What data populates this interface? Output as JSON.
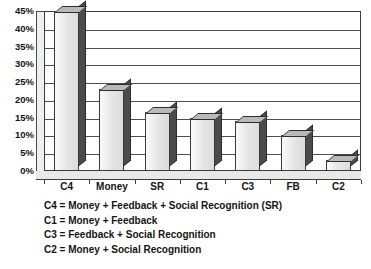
{
  "chart_data": {
    "type": "bar",
    "title": "",
    "subtitle": "",
    "xlabel": "",
    "ylabel": "",
    "categories": [
      "C4",
      "Money",
      "SR",
      "C1",
      "C3",
      "FB",
      "C2"
    ],
    "values": [
      45,
      23,
      16.5,
      15,
      14,
      10,
      3
    ],
    "series": [
      {
        "name": "Percent",
        "values": [
          45,
          23,
          16.5,
          15,
          14,
          10,
          3
        ]
      }
    ],
    "ylim": [
      0,
      45
    ],
    "ytick_values": [
      0,
      5,
      10,
      15,
      20,
      25,
      30,
      35,
      40,
      45
    ],
    "ytick_labels": [
      "0%",
      "5%",
      "10%",
      "15%",
      "20%",
      "25%",
      "30%",
      "35%",
      "40%",
      "45%"
    ],
    "grid": true,
    "grid_axis": "y",
    "legend_position": "none",
    "style": "3d-column",
    "annotations": [
      "C4 = Money + Feedback + Social Recognition (SR)",
      "C1 = Money + Feedback",
      "C3 = Feedback + Social Recognition",
      "C2 = Money + Social Recognition"
    ],
    "colors": {
      "bar_front": "#e4e4e4",
      "bar_side": "#4b4b4b",
      "bar_top": "#b9b9b9",
      "axis": "#3d3d3d",
      "gridline": "#4f4f4f",
      "text": "#141414",
      "background": "#ffffff"
    }
  }
}
